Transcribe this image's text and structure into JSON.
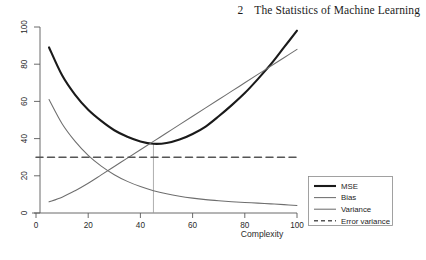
{
  "header": {
    "folio": "2",
    "title": "The Statistics of Machine Learning"
  },
  "chart_data": {
    "type": "line",
    "title": "",
    "xlabel": "Complexity",
    "ylabel": "",
    "xlim": [
      0,
      100
    ],
    "ylim": [
      0,
      100
    ],
    "xticks": [
      0,
      20,
      40,
      60,
      80,
      100
    ],
    "yticks": [
      0,
      20,
      40,
      60,
      80,
      100
    ],
    "xtick_labels": [
      "0",
      "20",
      "40",
      "60",
      "80",
      "100"
    ],
    "ytick_labels": [
      "0",
      "20",
      "40",
      "60",
      "80",
      "100"
    ],
    "grid": false,
    "legend_position": "right-outside",
    "series": [
      {
        "name": "MSE",
        "style": "solid",
        "color": "#1a1a1a",
        "width": 2.1,
        "x": [
          5,
          10,
          15,
          20,
          25,
          30,
          35,
          40,
          45,
          50,
          55,
          60,
          65,
          70,
          75,
          80,
          85,
          90,
          95,
          100
        ],
        "y": [
          89.0,
          74.0,
          63.5,
          55.5,
          49.5,
          44.5,
          41.0,
          38.5,
          37.2,
          37.6,
          39.5,
          42.5,
          46.5,
          52.0,
          58.0,
          64.5,
          72.0,
          80.0,
          89.0,
          98.0
        ]
      },
      {
        "name": "Bias",
        "style": "solid",
        "color": "#6e6e6e",
        "width": 1.05,
        "x": [
          5,
          10,
          15,
          20,
          25,
          30,
          35,
          40,
          45,
          50,
          55,
          60,
          65,
          70,
          75,
          80,
          85,
          90,
          95,
          100
        ],
        "y": [
          61.0,
          48.0,
          38.5,
          31.0,
          25.2,
          20.6,
          17.0,
          14.2,
          12.0,
          10.3,
          9.0,
          8.0,
          7.2,
          6.6,
          6.1,
          5.7,
          5.3,
          4.9,
          4.5,
          4.0
        ]
      },
      {
        "name": "Variance",
        "style": "solid",
        "color": "#6e6e6e",
        "width": 1.05,
        "x": [
          5,
          10,
          15,
          20,
          25,
          30,
          35,
          40,
          45,
          50,
          55,
          60,
          65,
          70,
          75,
          80,
          85,
          90,
          95,
          100
        ],
        "y": [
          6.0,
          8.5,
          12.0,
          16.0,
          20.5,
          25.0,
          29.5,
          34.0,
          38.5,
          43.0,
          47.5,
          52.0,
          56.5,
          61.0,
          65.5,
          70.0,
          74.5,
          79.0,
          83.5,
          88.0
        ]
      },
      {
        "name": "Error variance",
        "style": "dashed",
        "color": "#555555",
        "width": 1.5,
        "x": [
          0,
          100
        ],
        "y": [
          30,
          30
        ]
      }
    ],
    "annotations": [
      {
        "name": "optimal-complexity-marker",
        "type": "vline",
        "x": 45,
        "y_from": 0,
        "y_to": 37.2,
        "color": "#9a9a9a"
      }
    ],
    "legend_entries": [
      "MSE",
      "Bias",
      "Variance",
      "Error variance"
    ]
  }
}
